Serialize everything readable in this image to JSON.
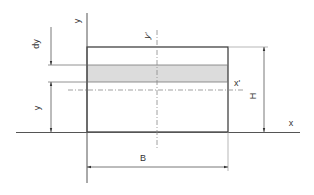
{
  "diagram": {
    "type": "rectangular-cross-section-dimension-drawing",
    "colors": {
      "line": "#333333",
      "thin_line": "#777777",
      "strip_fill": "#dcdcdc",
      "background": "#ffffff"
    },
    "labels": {
      "y_axis": "y",
      "y_prime_axis": "y'",
      "x_axis": "x",
      "x_prime_axis": "x'",
      "width": "B",
      "height": "H",
      "strip_thickness": "dy",
      "strip_offset": "y"
    }
  }
}
